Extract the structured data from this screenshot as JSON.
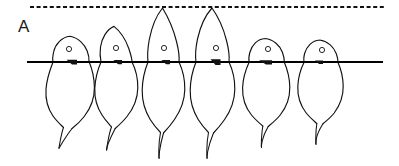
{
  "figure": {
    "panel_label": "A",
    "type": "line-drawing",
    "colors": {
      "ink": "#111111",
      "background": "#ffffff",
      "substrate": "#000000"
    },
    "reference_line": {
      "name": "dashed-reference-line",
      "style": "dashed",
      "y": 7,
      "x_start": 30,
      "x_end": 386,
      "dash_length": 4,
      "gap_length": 2.6
    },
    "substrate_line": {
      "name": "solid-substrate-line",
      "style": "solid",
      "y": 62,
      "x_start": 27,
      "x_end": 383
    },
    "cells": [
      {
        "index": 1,
        "label": "cell-1",
        "center_x": 69,
        "head_top_y": 36,
        "body_bottom_y": 125,
        "tail_tip_y": 148,
        "nucleus": {
          "cx": 69,
          "cy": 49,
          "r": 2.6
        },
        "attachment_mark": {
          "x": 70,
          "y": 61,
          "w": 9,
          "h": 4
        }
      },
      {
        "index": 2,
        "label": "cell-2",
        "center_x": 115,
        "head_top_y": 26,
        "body_bottom_y": 126,
        "tail_tip_y": 150,
        "nucleus": {
          "cx": 116,
          "cy": 48,
          "r": 2.6
        },
        "attachment_mark": {
          "x": 116,
          "y": 61,
          "w": 8,
          "h": 3.5
        }
      },
      {
        "index": 3,
        "label": "cell-3",
        "center_x": 163,
        "head_top_y": 8,
        "body_bottom_y": 132,
        "tail_tip_y": 158,
        "nucleus": {
          "cx": 164,
          "cy": 48,
          "r": 2.6
        },
        "attachment_mark": {
          "x": 164,
          "y": 61,
          "w": 8,
          "h": 3.5
        }
      },
      {
        "index": 4,
        "label": "cell-4",
        "center_x": 211,
        "head_top_y": 8,
        "body_bottom_y": 132,
        "tail_tip_y": 158,
        "nucleus": {
          "cx": 216,
          "cy": 48,
          "r": 2.6
        },
        "attachment_mark": {
          "x": 213,
          "y": 60,
          "w": 9,
          "h": 5
        }
      },
      {
        "index": 5,
        "label": "cell-5",
        "center_x": 262,
        "head_top_y": 38,
        "body_bottom_y": 124,
        "tail_tip_y": 147,
        "nucleus": {
          "cx": 268,
          "cy": 49,
          "r": 2.6
        },
        "attachment_mark": {
          "x": 262,
          "y": 61,
          "w": 11,
          "h": 4
        }
      },
      {
        "index": 6,
        "label": "cell-6",
        "center_x": 317,
        "head_top_y": 40,
        "body_bottom_y": 122,
        "tail_tip_y": 144,
        "nucleus": {
          "cx": 322,
          "cy": 50,
          "r": 2.6
        },
        "attachment_mark": {
          "x": 317,
          "y": 61,
          "w": 7,
          "h": 3
        }
      }
    ]
  }
}
